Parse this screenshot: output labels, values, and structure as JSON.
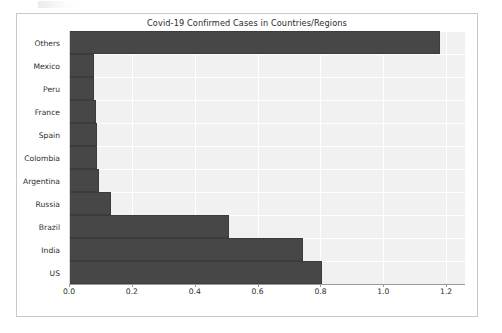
{
  "figure": {
    "title": "Covid-19 Confirmed Cases in Countries/Regions",
    "bar_color": "#474747",
    "plot_background": "#f1f1f1",
    "grid_color": "#ffffff",
    "frame_color": "#c9c9c9"
  },
  "chart_data": {
    "type": "bar",
    "orientation": "horizontal",
    "title": "Covid-19 Confirmed Cases in Countries/Regions",
    "xlabel": "",
    "ylabel": "",
    "categories": [
      "Others",
      "Mexico",
      "Peru",
      "France",
      "Spain",
      "Colombia",
      "Argentina",
      "Russia",
      "Brazil",
      "India",
      "US"
    ],
    "values": [
      1.18,
      0.08,
      0.08,
      0.085,
      0.09,
      0.09,
      0.095,
      0.135,
      0.51,
      0.745,
      0.805
    ],
    "xlim": [
      0.0,
      1.26
    ],
    "xticks": [
      0.0,
      0.2,
      0.4,
      0.6,
      0.8,
      1.0,
      1.2
    ],
    "xticklabels": [
      "0.0",
      "0.2",
      "0.4",
      "0.6",
      "0.8",
      "1.0",
      "1.2"
    ],
    "grid": true,
    "legend": null,
    "series": [
      {
        "name": "Confirmed Cases",
        "values": [
          1.18,
          0.08,
          0.08,
          0.085,
          0.09,
          0.09,
          0.095,
          0.135,
          0.51,
          0.745,
          0.805
        ]
      }
    ]
  }
}
